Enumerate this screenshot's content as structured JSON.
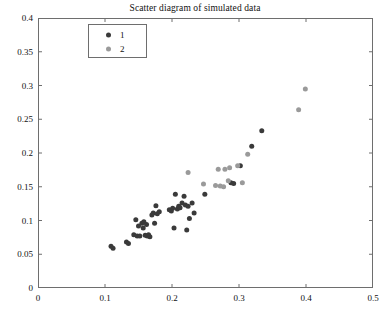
{
  "chart_data": {
    "type": "scatter",
    "title": "Scatter diagram of simulated data",
    "xlabel": "",
    "ylabel": "",
    "xlim": [
      0,
      0.5
    ],
    "ylim": [
      0,
      0.4
    ],
    "xticks": [
      0,
      0.1,
      0.2,
      0.3,
      0.4,
      0.5
    ],
    "xtick_labels": [
      "0",
      "0.1",
      "0.2",
      "0.3",
      "0.4",
      "0.5"
    ],
    "yticks": [
      0,
      0.05,
      0.1,
      0.15,
      0.2,
      0.25,
      0.3,
      0.35,
      0.4
    ],
    "ytick_labels": [
      "0",
      "0.05",
      "0.1",
      "0.15",
      "0.2",
      "0.25",
      "0.3",
      "0.35",
      "0.4"
    ],
    "grid": false,
    "legend_position": "upper-left-inset",
    "marker_size_px": 5,
    "series": [
      {
        "name": "1",
        "label": "1",
        "color": "#3a3a3a",
        "points": [
          [
            0.109,
            0.062
          ],
          [
            0.112,
            0.059
          ],
          [
            0.132,
            0.068
          ],
          [
            0.135,
            0.066
          ],
          [
            0.143,
            0.079
          ],
          [
            0.146,
            0.101
          ],
          [
            0.148,
            0.077
          ],
          [
            0.15,
            0.092
          ],
          [
            0.152,
            0.077
          ],
          [
            0.155,
            0.096
          ],
          [
            0.157,
            0.089
          ],
          [
            0.158,
            0.098
          ],
          [
            0.16,
            0.078
          ],
          [
            0.162,
            0.094
          ],
          [
            0.163,
            0.077
          ],
          [
            0.165,
            0.079
          ],
          [
            0.167,
            0.076
          ],
          [
            0.17,
            0.108
          ],
          [
            0.172,
            0.111
          ],
          [
            0.174,
            0.096
          ],
          [
            0.176,
            0.122
          ],
          [
            0.178,
            0.11
          ],
          [
            0.181,
            0.113
          ],
          [
            0.196,
            0.116
          ],
          [
            0.199,
            0.114
          ],
          [
            0.201,
            0.118
          ],
          [
            0.203,
            0.089
          ],
          [
            0.205,
            0.139
          ],
          [
            0.208,
            0.117
          ],
          [
            0.21,
            0.121
          ],
          [
            0.212,
            0.119
          ],
          [
            0.215,
            0.126
          ],
          [
            0.218,
            0.136
          ],
          [
            0.22,
            0.123
          ],
          [
            0.222,
            0.086
          ],
          [
            0.224,
            0.121
          ],
          [
            0.226,
            0.103
          ],
          [
            0.23,
            0.126
          ],
          [
            0.233,
            0.111
          ],
          [
            0.249,
            0.139
          ],
          [
            0.288,
            0.156
          ],
          [
            0.292,
            0.155
          ],
          [
            0.302,
            0.181
          ],
          [
            0.319,
            0.21
          ],
          [
            0.334,
            0.233
          ]
        ]
      },
      {
        "name": "2",
        "label": "2",
        "color": "#9a9a9a",
        "points": [
          [
            0.224,
            0.171
          ],
          [
            0.247,
            0.154
          ],
          [
            0.265,
            0.152
          ],
          [
            0.269,
            0.176
          ],
          [
            0.272,
            0.151
          ],
          [
            0.277,
            0.15
          ],
          [
            0.279,
            0.176
          ],
          [
            0.284,
            0.159
          ],
          [
            0.286,
            0.178
          ],
          [
            0.298,
            0.181
          ],
          [
            0.305,
            0.156
          ],
          [
            0.313,
            0.198
          ],
          [
            0.389,
            0.264
          ],
          [
            0.399,
            0.295
          ]
        ]
      }
    ]
  }
}
